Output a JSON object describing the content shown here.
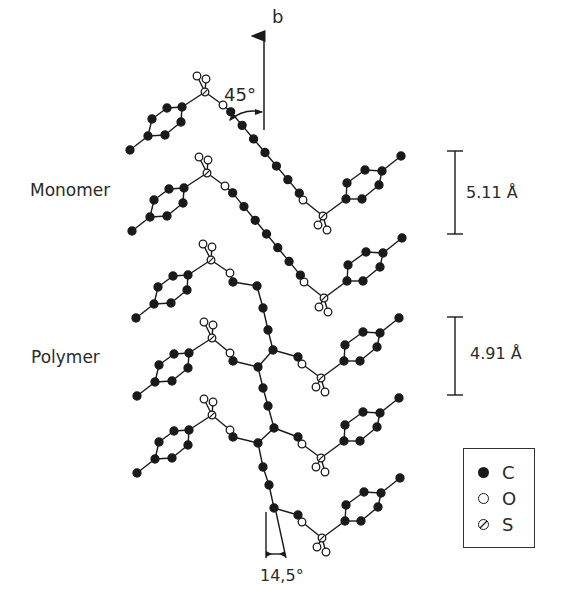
{
  "labels": {
    "axis": "b",
    "angle_top": "45°",
    "monomer": "Monomer",
    "polymer": "Polymer",
    "dist_monomer": "5.11 Å",
    "dist_polymer": "4.91 Å",
    "angle_bottom": "14,5°"
  },
  "legend": [
    {
      "symbol": "filled-circle",
      "element": "C"
    },
    {
      "symbol": "open-circle",
      "element": "O"
    },
    {
      "symbol": "hatched-circle",
      "element": "S"
    }
  ],
  "colors": {
    "ink": "#1a1a1a",
    "paper": "#ffffff"
  },
  "scale_bars": [
    {
      "name": "monomer",
      "y1": 151,
      "y2": 234,
      "x": 455
    },
    {
      "name": "polymer",
      "y1": 317,
      "y2": 395,
      "x": 455
    }
  ],
  "rows": [
    {
      "type": "monomer",
      "leftS": [
        205,
        92
      ],
      "rightS": [
        323,
        216
      ]
    },
    {
      "type": "monomer",
      "leftS": [
        207,
        173
      ],
      "rightS": [
        324,
        298
      ]
    },
    {
      "type": "polymer",
      "leftS": [
        211,
        260
      ],
      "rightS": [
        321,
        378
      ]
    },
    {
      "type": "polymer",
      "leftS": [
        212,
        338
      ],
      "rightS": [
        321,
        458
      ]
    },
    {
      "type": "polymer",
      "leftS": [
        212,
        415
      ],
      "rightS": [
        322,
        538
      ]
    }
  ],
  "polymer_backbone": [
    [
      233,
      282
    ],
    [
      257,
      286
    ],
    [
      263,
      308
    ],
    [
      268,
      330
    ],
    [
      273,
      350
    ],
    [
      258,
      367
    ],
    [
      263,
      388
    ],
    [
      268,
      406
    ],
    [
      274,
      428
    ],
    [
      258,
      443
    ],
    [
      263,
      467
    ],
    [
      269,
      485
    ],
    [
      274,
      508
    ]
  ]
}
